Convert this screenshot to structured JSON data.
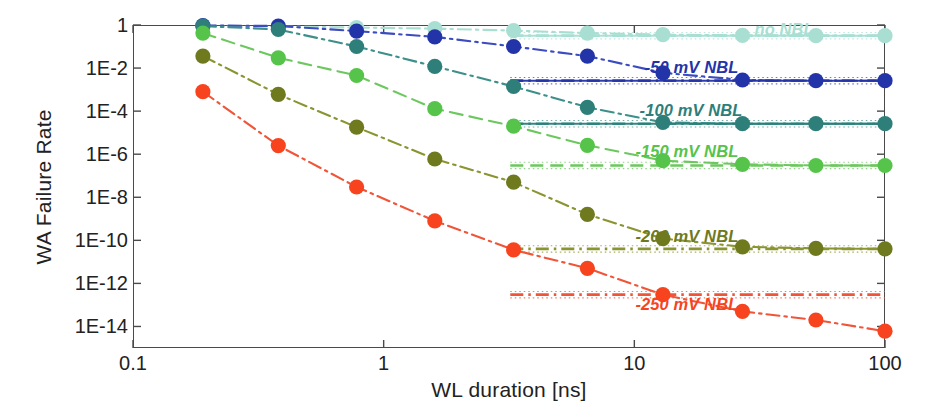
{
  "chart_data": {
    "type": "scatter",
    "title": "",
    "xlabel": "WL duration [ns]",
    "ylabel": "WA Failure Rate",
    "xscale": "log",
    "yscale": "log",
    "xlim": [
      0.1,
      100
    ],
    "ylim": [
      1e-15,
      1
    ],
    "xticks": [
      "0.1",
      "1",
      "10",
      "100"
    ],
    "xtick_values": [
      0.1,
      1,
      10,
      100
    ],
    "yticks": [
      "1",
      "1E-2",
      "1E-4",
      "1E-6",
      "1E-8",
      "1E-10",
      "1E-12",
      "1E-14"
    ],
    "ytick_values": [
      1,
      0.01,
      0.0001,
      1e-06,
      1e-08,
      1e-10,
      1e-12,
      1e-14
    ],
    "grid": false,
    "legend_position": "inside-right",
    "series": [
      {
        "name": "no NBL",
        "label": "no NBL",
        "color": "#a8dfd2",
        "line_color": "#a8dfd2",
        "line_style": "dash-dot",
        "floor": 0.32,
        "label_x": 52,
        "label_y": 0.62,
        "x": [
          0.19,
          0.38,
          0.78,
          1.6,
          3.3,
          6.5,
          13,
          27,
          53,
          100
        ],
        "y": [
          0.92,
          0.85,
          0.76,
          0.68,
          0.55,
          0.42,
          0.36,
          0.33,
          0.32,
          0.32
        ]
      },
      {
        "name": "-50 mV NBL",
        "label": "-50 mV NBL",
        "color": "#2334a8",
        "line_color": "#3b4bc0",
        "line_style": "dash-dot",
        "floor": 0.0026,
        "label_x": 26,
        "label_y": 0.011,
        "x": [
          0.19,
          0.38,
          0.78,
          1.6,
          3.3,
          6.5,
          13,
          27,
          53,
          100
        ],
        "y": [
          0.95,
          0.9,
          0.52,
          0.28,
          0.1,
          0.036,
          0.006,
          0.0028,
          0.0026,
          0.0026
        ]
      },
      {
        "name": "-100 mV NBL",
        "label": "-100 mV NBL",
        "color": "#2e7f7a",
        "line_color": "#3d8f8a",
        "line_style": "dash-dot",
        "floor": 2.6e-05,
        "label_x": 27,
        "label_y": 0.00011,
        "x": [
          0.19,
          0.38,
          0.78,
          1.6,
          3.3,
          6.5,
          13,
          27,
          53,
          100
        ],
        "y": [
          0.9,
          0.62,
          0.1,
          0.012,
          0.0014,
          0.00015,
          3e-05,
          2.6e-05,
          2.6e-05,
          2.6e-05
        ]
      },
      {
        "name": "-150 mV NBL",
        "label": "-150 mV NBL",
        "color": "#56c44a",
        "line_color": "#6cc85e",
        "line_style": "dashed",
        "floor": 3e-07,
        "label_x": 26,
        "label_y": 1.4e-06,
        "x": [
          0.19,
          0.38,
          0.78,
          1.6,
          3.3,
          6.5,
          13,
          27,
          53,
          100
        ],
        "y": [
          0.42,
          0.03,
          0.0045,
          0.00013,
          2e-05,
          2.6e-06,
          5e-07,
          3.4e-07,
          3e-07,
          3e-07
        ]
      },
      {
        "name": "-200 mV NBL",
        "label": "-200 mV NBL",
        "color": "#6f7a1e",
        "line_color": "#8a9430",
        "line_style": "dash-dot",
        "floor": 4e-11,
        "label_x": 26,
        "label_y": 1.6e-10,
        "x": [
          0.19,
          0.38,
          0.78,
          1.6,
          3.3,
          6.5,
          13,
          27,
          53,
          100
        ],
        "y": [
          0.036,
          0.0006,
          1.8e-05,
          6e-07,
          5e-08,
          1.6e-09,
          1.2e-10,
          5e-11,
          4.2e-11,
          4e-11
        ]
      },
      {
        "name": "-250 mV NBL",
        "label": "-250 mV NBL",
        "color": "#f7441f",
        "line_color": "#f0553a",
        "line_style": "dash-dot",
        "floor": 3e-13,
        "label_x": 26,
        "label_y": 1.1e-13,
        "x": [
          0.19,
          0.38,
          0.78,
          1.6,
          3.3,
          6.5,
          13,
          27,
          53,
          100
        ],
        "y": [
          0.0008,
          2.5e-06,
          3e-08,
          8e-10,
          3.6e-11,
          5e-12,
          3e-13,
          5e-14,
          2e-14,
          6e-15
        ]
      }
    ]
  }
}
